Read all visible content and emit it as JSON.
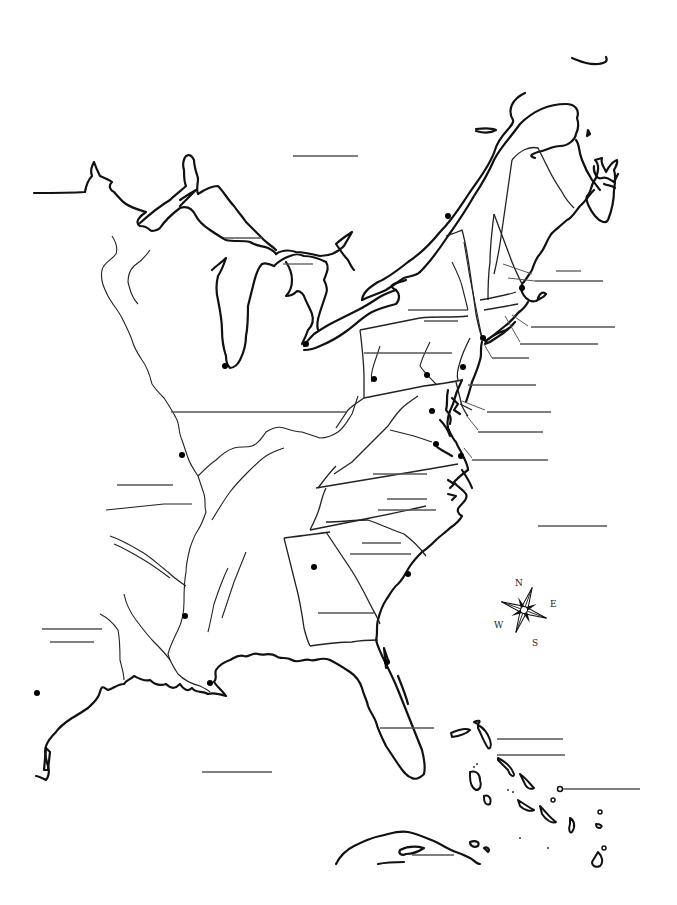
{
  "map": {
    "title": "",
    "region": "Eastern North America outline map",
    "background": "#ffffff",
    "line_color": "#111111",
    "blank_line_color": "#555555"
  },
  "compass": {
    "icon": "compass-rose-icon",
    "north": "N",
    "east": "E",
    "south": "S",
    "west": "W"
  },
  "label_blanks": [
    {
      "id": "blank-north-canada",
      "x1": 293,
      "y1": 156,
      "x2": 358,
      "y2": 156
    },
    {
      "id": "blank-lake-superior",
      "x1": 224,
      "y1": 238,
      "x2": 262,
      "y2": 238
    },
    {
      "id": "blank-lake-huron",
      "x1": 283,
      "y1": 264,
      "x2": 313,
      "y2": 264
    },
    {
      "id": "blank-maine-1",
      "x1": 556,
      "y1": 271,
      "x2": 581,
      "y2": 271
    },
    {
      "id": "blank-maine-2",
      "x1": 535,
      "y1": 281,
      "x2": 603,
      "y2": 281
    },
    {
      "id": "blank-new-york-1",
      "x1": 408,
      "y1": 310,
      "x2": 468,
      "y2": 310
    },
    {
      "id": "blank-new-york-2",
      "x1": 424,
      "y1": 321,
      "x2": 458,
      "y2": 321
    },
    {
      "id": "blank-rhode-island",
      "x1": 531,
      "y1": 327,
      "x2": 615,
      "y2": 327
    },
    {
      "id": "blank-connecticut",
      "x1": 520,
      "y1": 344,
      "x2": 598,
      "y2": 344
    },
    {
      "id": "blank-pennsylvania",
      "x1": 364,
      "y1": 353,
      "x2": 452,
      "y2": 353
    },
    {
      "id": "blank-new-jersey",
      "x1": 492,
      "y1": 358,
      "x2": 529,
      "y2": 358
    },
    {
      "id": "blank-delaware-1",
      "x1": 468,
      "y1": 385,
      "x2": 536,
      "y2": 385
    },
    {
      "id": "blank-delaware-2",
      "x1": 487,
      "y1": 412,
      "x2": 551,
      "y2": 412
    },
    {
      "id": "blank-maryland",
      "x1": 478,
      "y1": 432,
      "x2": 543,
      "y2": 432
    },
    {
      "id": "blank-northwest-territory",
      "x1": 171,
      "y1": 412,
      "x2": 346,
      "y2": 412
    },
    {
      "id": "blank-virginia",
      "x1": 472,
      "y1": 460,
      "x2": 548,
      "y2": 460
    },
    {
      "id": "blank-kentucky",
      "x1": 373,
      "y1": 474,
      "x2": 427,
      "y2": 474
    },
    {
      "id": "blank-west-1",
      "x1": 117,
      "y1": 485,
      "x2": 173,
      "y2": 485
    },
    {
      "id": "blank-north-carolina-1",
      "x1": 387,
      "y1": 499,
      "x2": 427,
      "y2": 499
    },
    {
      "id": "blank-north-carolina-2",
      "x1": 378,
      "y1": 510,
      "x2": 436,
      "y2": 510
    },
    {
      "id": "blank-atlantic-ocean",
      "x1": 538,
      "y1": 526,
      "x2": 607,
      "y2": 526
    },
    {
      "id": "blank-south-carolina-1",
      "x1": 362,
      "y1": 543,
      "x2": 401,
      "y2": 543
    },
    {
      "id": "blank-south-carolina-2",
      "x1": 350,
      "y1": 554,
      "x2": 411,
      "y2": 554
    },
    {
      "id": "blank-georgia",
      "x1": 318,
      "y1": 613,
      "x2": 374,
      "y2": 613
    },
    {
      "id": "blank-louisiana-1",
      "x1": 42,
      "y1": 629,
      "x2": 102,
      "y2": 629
    },
    {
      "id": "blank-louisiana-2",
      "x1": 50,
      "y1": 642,
      "x2": 94,
      "y2": 642
    },
    {
      "id": "blank-florida",
      "x1": 380,
      "y1": 728,
      "x2": 434,
      "y2": 728
    },
    {
      "id": "blank-bahamas-1",
      "x1": 497,
      "y1": 739,
      "x2": 563,
      "y2": 739
    },
    {
      "id": "blank-bahamas-2",
      "x1": 497,
      "y1": 755,
      "x2": 565,
      "y2": 755
    },
    {
      "id": "blank-gulf-of-mexico",
      "x1": 202,
      "y1": 772,
      "x2": 272,
      "y2": 772
    },
    {
      "id": "blank-caribbean",
      "x1": 563,
      "y1": 789,
      "x2": 640,
      "y2": 789
    },
    {
      "id": "blank-cuba",
      "x1": 412,
      "y1": 855,
      "x2": 454,
      "y2": 855
    }
  ],
  "cities": [
    {
      "id": "city-quebec",
      "x": 448,
      "y": 216
    },
    {
      "id": "city-boston",
      "x": 522,
      "y": 288
    },
    {
      "id": "city-detroit",
      "x": 306,
      "y": 344
    },
    {
      "id": "city-new-york",
      "x": 483,
      "y": 338
    },
    {
      "id": "city-chicago",
      "x": 225,
      "y": 366
    },
    {
      "id": "city-pittsburgh",
      "x": 374,
      "y": 379
    },
    {
      "id": "city-harrisburg",
      "x": 427,
      "y": 375
    },
    {
      "id": "city-philadelphia",
      "x": 463,
      "y": 367
    },
    {
      "id": "city-washington",
      "x": 432,
      "y": 411
    },
    {
      "id": "city-richmond",
      "x": 436,
      "y": 444
    },
    {
      "id": "city-norfolk",
      "x": 461,
      "y": 456
    },
    {
      "id": "city-st-louis",
      "x": 182,
      "y": 455
    },
    {
      "id": "city-atlanta",
      "x": 314,
      "y": 567
    },
    {
      "id": "city-charleston",
      "x": 408,
      "y": 574
    },
    {
      "id": "city-natchez",
      "x": 185,
      "y": 616
    },
    {
      "id": "city-new-orleans",
      "x": 210,
      "y": 683
    },
    {
      "id": "city-st-augustine",
      "x": 387,
      "y": 662
    },
    {
      "id": "city-san-antonio",
      "x": 37,
      "y": 693
    }
  ]
}
